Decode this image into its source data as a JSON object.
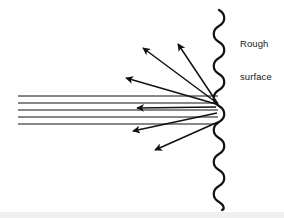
{
  "figure": {
    "title_label": "Rough surface",
    "label_line_1": "Rough",
    "label_line_2": "surface",
    "background_color": "#ffffff",
    "stroke_color": "#111111",
    "bottom_band_color": "#f0f0f0",
    "width": 284,
    "height": 218
  },
  "diagram_data": {
    "type": "ray-diagram",
    "subject": "diffuse reflection of a parallel light beam from a rough surface",
    "surface": {
      "name": "rough-surface",
      "shape": "vertical sine wave",
      "center_x": 219,
      "amplitude": 7,
      "period": 16,
      "y_start": 10,
      "y_end": 210,
      "stroke_width": 2.2,
      "color": "#111111"
    },
    "incident_rays": {
      "count": 5,
      "direction": "left-to-right horizontal",
      "x_start": 18,
      "x_end": 218,
      "y_values": [
        96,
        103,
        110,
        117,
        124
      ],
      "stroke_width": 1.1,
      "color": "#111111"
    },
    "scattered_rays": [
      {
        "name": "scattered-ray-1",
        "from_x": 217,
        "from_y": 103,
        "to_x": 140,
        "to_y": 45,
        "direction": "up-left-steep"
      },
      {
        "name": "scattered-ray-2",
        "from_x": 218,
        "from_y": 104,
        "to_x": 176,
        "to_y": 40,
        "direction": "up-left-very-steep"
      },
      {
        "name": "scattered-ray-3",
        "from_x": 216,
        "from_y": 104,
        "to_x": 122,
        "to_y": 77,
        "direction": "up-left-shallow"
      },
      {
        "name": "scattered-ray-4",
        "from_x": 216,
        "from_y": 107,
        "to_x": 133,
        "to_y": 108,
        "direction": "left-horizontal"
      },
      {
        "name": "scattered-ray-5",
        "from_x": 217,
        "from_y": 113,
        "to_x": 129,
        "to_y": 133,
        "direction": "down-left-shallow"
      },
      {
        "name": "scattered-ray-6",
        "from_x": 218,
        "from_y": 122,
        "to_x": 151,
        "to_y": 153,
        "direction": "down-left-steep"
      }
    ],
    "labels": [
      {
        "name": "rough-surface-label",
        "text": "Rough surface",
        "x": 240,
        "y": 16
      }
    ]
  }
}
